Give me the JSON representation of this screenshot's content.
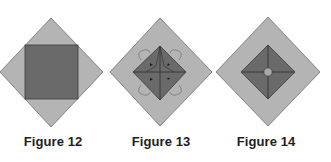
{
  "colors": {
    "outer_fill": "#b4b4b4",
    "outer_stroke": "#6e6e6e",
    "inner_fill": "#6a6a6a",
    "inner_stroke": "#3c3c3c",
    "fold_line": "#2e2e2e",
    "arrow": "#1a1a1a",
    "circle_fill": "#a8a8a8",
    "caption": "#1e1e1e",
    "background": "#ffffff"
  },
  "figures": [
    {
      "id": "figure-12",
      "caption": "Figure 12",
      "description": "Gray diamond (square rotated 45°) with a dark square inset, its corners touching the diamond's edges"
    },
    {
      "id": "figure-13",
      "caption": "Figure 13",
      "description": "Gray diamond with corners folded in to a central dark diamond; fold lines and small arrows point toward the center; curved arrows at the corner flaps"
    },
    {
      "id": "figure-14",
      "caption": "Figure 14",
      "description": "Gray diamond with a dark inner diamond divided by crossing fold lines and a small light circle at the center"
    }
  ]
}
